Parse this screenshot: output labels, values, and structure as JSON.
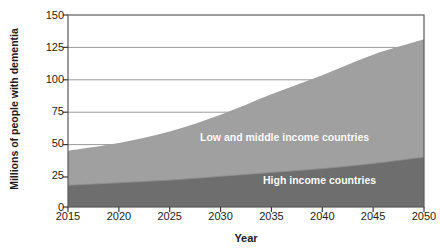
{
  "chart_data": {
    "type": "area",
    "stacked": true,
    "title": "",
    "xlabel": "Year",
    "ylabel": "Millions of people with dementia",
    "x": [
      2015,
      2020,
      2025,
      2030,
      2035,
      2040,
      2045,
      2050
    ],
    "xlim": [
      2015,
      2050
    ],
    "ylim": [
      0,
      150
    ],
    "xticks": [
      "2015",
      "2020",
      "2025",
      "2030",
      "2035",
      "2040",
      "2045",
      "2050"
    ],
    "yticks": [
      "0",
      "25",
      "50",
      "75",
      "100",
      "125",
      "150"
    ],
    "grid": "horizontal",
    "legend_position": "inside-plot",
    "series": [
      {
        "name": "High income countries",
        "color": "#6e6e6e",
        "values": [
          17,
          19,
          21,
          24,
          27,
          30,
          34,
          39
        ]
      },
      {
        "name": "Low and middle income countries",
        "color": "#a0a0a0",
        "values": [
          27,
          31,
          38,
          48,
          61,
          73,
          85,
          92
        ]
      }
    ],
    "totals": [
      44,
      50,
      59,
      72,
      88,
      103,
      119,
      131
    ],
    "annotations": [
      {
        "text": "Low and middle income countries",
        "series": "Low and middle income countries"
      },
      {
        "text": "High income countries",
        "series": "High income countries"
      }
    ]
  },
  "axes": {
    "y_title": "Millions of people with dementia",
    "x_title": "Year",
    "y_ticks": [
      "150",
      "125",
      "100",
      "75",
      "50",
      "25",
      "0"
    ],
    "x_ticks": [
      "2015",
      "2020",
      "2025",
      "2030",
      "2035",
      "2040",
      "2045",
      "2050"
    ]
  },
  "colors": {
    "low_middle_income": "#a0a0a0",
    "high_income": "#6e6e6e",
    "grid": "#9a9a9a",
    "frame": "#5a5a5a",
    "text": "#1b1b1b",
    "label_text": "#ffffff",
    "background": "#ffffff"
  }
}
